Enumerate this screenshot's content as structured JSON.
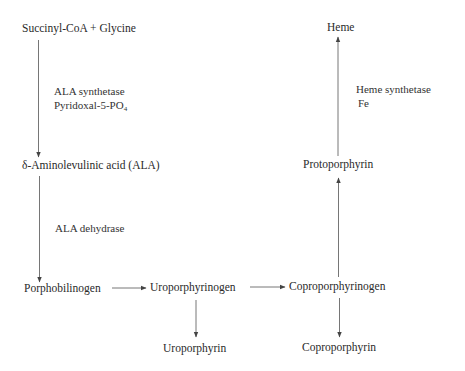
{
  "diagram": {
    "type": "metabolic-pathway",
    "nodes": {
      "succinyl_glycine": "Succinyl-CoA + Glycine",
      "ala": "δ-Aminolevulinic acid (ALA)",
      "porphobilinogen": "Porphobilinogen",
      "uroporphyrinogen": "Uroporphyrinogen",
      "coproporphyrinogen": "Coproporphyrinogen",
      "uroporphyrin": "Uroporphyrin",
      "coproporphyrin": "Coproporphyrin",
      "protoporphyrin": "Protoporphyrin",
      "heme": "Heme"
    },
    "enzymes": {
      "ala_synthetase": "ALA synthetase",
      "pyridoxal_base": "Pyridoxal-5-PO",
      "pyridoxal_sub": "4",
      "ala_dehydrase": "ALA dehydrase",
      "heme_synthetase": "Heme synthetase",
      "fe": "Fe"
    },
    "edges": [
      {
        "from": "Succinyl-CoA + Glycine",
        "to": "δ-Aminolevulinic acid (ALA)",
        "label": "ALA synthetase, Pyridoxal-5-PO4"
      },
      {
        "from": "δ-Aminolevulinic acid (ALA)",
        "to": "Porphobilinogen",
        "label": "ALA dehydrase"
      },
      {
        "from": "Porphobilinogen",
        "to": "Uroporphyrinogen"
      },
      {
        "from": "Uroporphyrinogen",
        "to": "Coproporphyrinogen"
      },
      {
        "from": "Uroporphyrinogen",
        "to": "Uroporphyrin"
      },
      {
        "from": "Coproporphyrinogen",
        "to": "Coproporphyrin"
      },
      {
        "from": "Coproporphyrinogen",
        "to": "Protoporphyrin"
      },
      {
        "from": "Protoporphyrin",
        "to": "Heme",
        "label": "Heme synthetase, Fe"
      }
    ],
    "colors": {
      "line": "#555555",
      "text": "#2a2a2a",
      "background": "#ffffff"
    }
  }
}
